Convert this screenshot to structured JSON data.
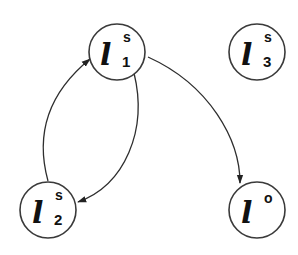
{
  "diagram": {
    "type": "directed-graph",
    "nodes": [
      {
        "id": "l1s",
        "symbol": "l",
        "superscript": "s",
        "subscript": "1"
      },
      {
        "id": "l3s",
        "symbol": "l",
        "superscript": "s",
        "subscript": "3"
      },
      {
        "id": "l2s",
        "symbol": "l",
        "superscript": "s",
        "subscript": "2"
      },
      {
        "id": "lo",
        "symbol": "l",
        "superscript": "o",
        "subscript": ""
      }
    ],
    "edges": [
      {
        "from": "l1s",
        "to": "l2s"
      },
      {
        "from": "l2s",
        "to": "l1s"
      },
      {
        "from": "l1s",
        "to": "lo"
      }
    ],
    "colors": {
      "stroke": "#3a3a3a",
      "text": "#111111",
      "background": "#ffffff"
    }
  }
}
